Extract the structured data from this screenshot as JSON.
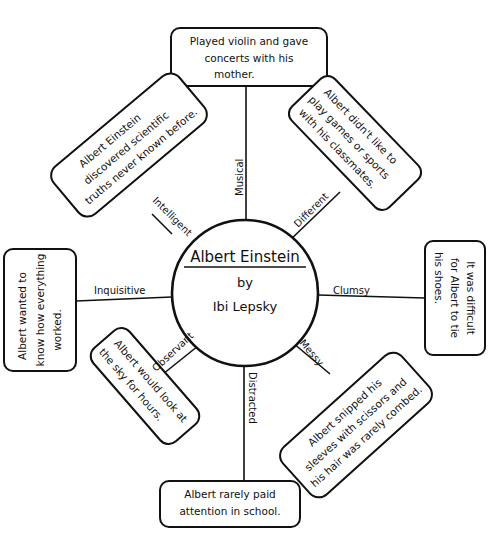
{
  "center": {
    "title": "Albert Einstein",
    "by": "by",
    "author": "Ibi Lepsky"
  },
  "spokes": [
    {
      "id": "musical",
      "trait": "Musical",
      "detail": [
        "Played violin and gave",
        "concerts with his",
        "mother."
      ]
    },
    {
      "id": "different",
      "trait": "Different",
      "detail": [
        "Albert didn't like to",
        "play games or sports",
        "with his classmates."
      ]
    },
    {
      "id": "clumsy",
      "trait": "Clumsy",
      "detail": [
        "It was difficult",
        "for Albert to tie",
        "his shoes."
      ]
    },
    {
      "id": "messy",
      "trait": "Messy",
      "detail": [
        "Albert snipped his",
        "sleeves with scissors and",
        "his hair was rarely combed."
      ]
    },
    {
      "id": "distracted",
      "trait": "Distracted",
      "detail": [
        "Albert rarely paid",
        "attention in school."
      ]
    },
    {
      "id": "observant",
      "trait": "Observant",
      "detail": [
        "Albert would look at",
        "the sky for hours."
      ]
    },
    {
      "id": "inquisitive",
      "trait": "Inquisitive",
      "detail": [
        "Albert wanted to",
        "know how everything",
        "worked."
      ]
    },
    {
      "id": "intelligent",
      "trait": "Intelligent",
      "detail": [
        "Albert Einstein",
        "discovered scientific",
        "truths never known before."
      ]
    }
  ]
}
